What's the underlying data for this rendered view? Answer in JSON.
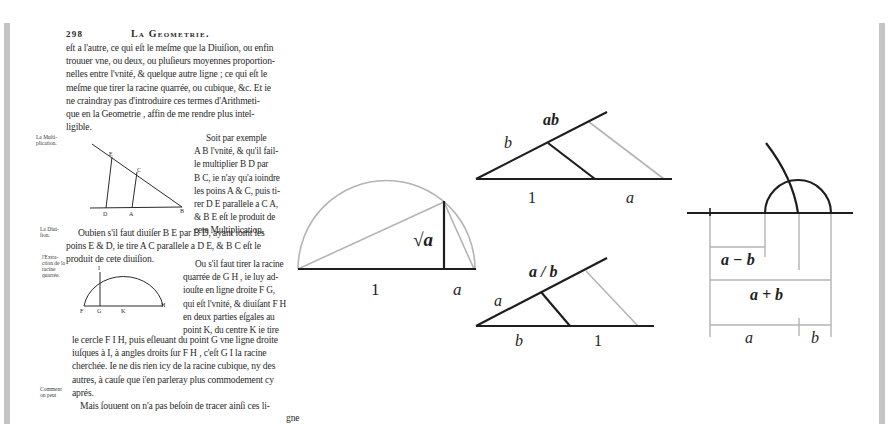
{
  "page": {
    "number": "298",
    "running_head": "La Geometrie.",
    "paragraph1": [
      "eſt a l'autre, ce qui eſt le meſme que la Diuiſion, ou enfin",
      "trouuer vne, ou deux, ou pluſieurs moyennes proportion-",
      "nelles entre l'vnité, & quelque autre ligne ; ce qui eſt le",
      "meſme que tirer la racine quarrée, ou cubique, &c. Et ie",
      "ne craindray pas d'introduire ces termes d'Arithmeti-",
      "que en la Geometrie , affin de me rendre plus intel-",
      "ligible."
    ],
    "margin_notes": {
      "multiplication": "La Multi- plication.",
      "division": "La Diui- ſion.",
      "extraction": "l'Extra- ction de la racine quarrée.",
      "comment": "Comment on peut"
    },
    "multiplication_text": [
      "Soit par exemple",
      "A B l'vnité, & qu'il fail-",
      "le multiplier B D par",
      "B C, ie n'ay qu'a ioindre",
      "les poins A & C, puis ti-",
      "rer D E parallele a C A,",
      "& B E eſt le produit de",
      "cete Multiplication."
    ],
    "division_text": [
      "Oubien s'il faut diuiſer B E par B D, ayant ioint les",
      "poins E & D, ie tire A C parallele a D E, & B C eſt le",
      "produit de cete diuiſion."
    ],
    "root_text_right": [
      "Ou s'il faut tirer la racine",
      "quarrée de G H , ie luy ad-",
      "iouſte en ligne droite F G,",
      "qui eſt l'vnité, & diuiſant F H",
      "en deux parties eſgales au",
      "point K, du centre K ie tire"
    ],
    "root_text_full": [
      "le cercle F I H, puis eſleuant du point G vne ligne droite",
      "iuſques à I, à angles droits ſur F H , c'eſt G I la racine",
      "cherchée. Ie ne dis rien icy de la racine cubique, ny des",
      "autres, à cauſe que i'en parleray plus commodement cy",
      "aprés."
    ],
    "last_line": "Mais ſouuent on n'a pas beſoin de tracer ainſi ces li-",
    "catchword": "gne",
    "fig_mult_labels": {
      "E": "E",
      "C": "C",
      "D": "D",
      "A": "A",
      "B": "B"
    },
    "fig_root_labels": {
      "I": "I",
      "F": "F",
      "G": "G",
      "K": "K",
      "H": "H"
    }
  },
  "diagrams": {
    "sqrt": {
      "label_root": "√a",
      "label_one": "1",
      "label_a": "a"
    },
    "product": {
      "label_ab": "ab",
      "label_b": "b",
      "label_one": "1",
      "label_a": "a"
    },
    "quotient": {
      "label_ab": "a / b",
      "label_a": "a",
      "label_b": "b",
      "label_one": "1"
    },
    "sum_diff": {
      "label_diff": "a − b",
      "label_sum": "a + b",
      "label_a": "a",
      "label_b": "b"
    }
  },
  "colors": {
    "ink": "#1e1e1e",
    "construction": "#b4b4b4",
    "bar": "#c4c4c4"
  }
}
